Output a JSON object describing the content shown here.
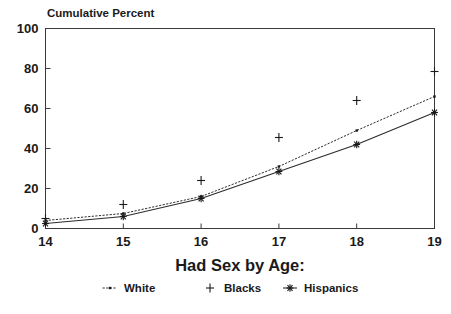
{
  "chart_data": {
    "type": "line",
    "title": "Cumulative Percent",
    "xlabel": "Had Sex by Age:",
    "ylabel": "",
    "x": [
      14,
      15,
      16,
      17,
      18,
      19
    ],
    "xticklabels": [
      "14",
      "15",
      "16",
      "17",
      "18",
      "19"
    ],
    "yticklabels": [
      "0",
      "20",
      "40",
      "60",
      "80",
      "100"
    ],
    "yticks": [
      0,
      20,
      40,
      60,
      80,
      100
    ],
    "xlim": [
      14,
      19
    ],
    "ylim": [
      0,
      100
    ],
    "grid": false,
    "legend_position": "below",
    "series": [
      {
        "name": "White",
        "marker": "dot",
        "line": "dotted",
        "values": [
          4,
          7.5,
          16,
          31,
          49,
          66
        ]
      },
      {
        "name": "Blacks",
        "marker": "plus",
        "line": "none",
        "values": [
          5,
          12,
          24,
          45.5,
          64,
          78.5
        ]
      },
      {
        "name": "Hispanics",
        "marker": "asterisk",
        "line": "solid",
        "values": [
          2.5,
          6,
          15,
          28.5,
          42,
          58
        ]
      }
    ]
  },
  "legend": {
    "items": [
      {
        "label": "White"
      },
      {
        "label": "Blacks"
      },
      {
        "label": "Hispanics"
      }
    ]
  },
  "colors": {
    "ink": "#1a1a1a",
    "axis": "#3a3a3a",
    "background": "#ffffff"
  }
}
